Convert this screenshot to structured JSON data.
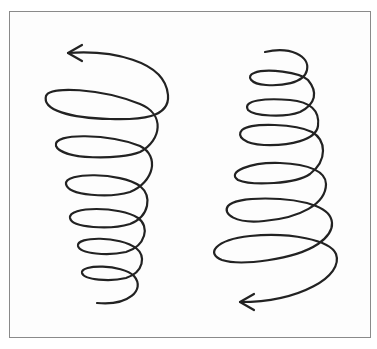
{
  "diagram": {
    "stroke_color": "#222222",
    "frame_color": "#8a8a8a",
    "background": "#ffffff",
    "spirals": [
      {
        "id": "left-spiral",
        "label": "Spiral narrowing downward, arrow pointing left at top",
        "arrow_position": "top",
        "arrow_direction": "left",
        "turns": 6
      },
      {
        "id": "right-spiral",
        "label": "Spiral widening downward, arrow pointing left at bottom",
        "arrow_position": "bottom",
        "arrow_direction": "left",
        "turns": 6
      }
    ]
  }
}
